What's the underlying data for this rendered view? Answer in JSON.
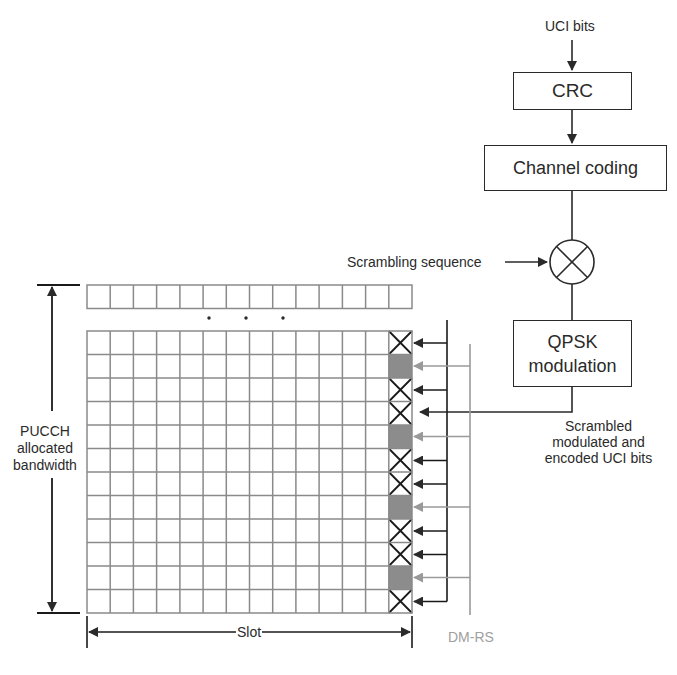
{
  "diagram": {
    "input_label": "UCI bits",
    "blocks": [
      {
        "id": "crc",
        "label": "CRC"
      },
      {
        "id": "channel_coding",
        "label": "Channel coding"
      },
      {
        "id": "scrambler",
        "label": "⊗",
        "shape": "circle-multiply"
      },
      {
        "id": "qpsk",
        "label_line1": "QPSK",
        "label_line2": "modulation"
      }
    ],
    "scrambling_label": "Scrambling sequence",
    "output_label_lines": [
      "Scrambled",
      "modulated and",
      "encoded UCI bits"
    ],
    "bandwidth_label_lines": [
      "PUCCH",
      "allocated",
      "bandwidth"
    ],
    "slot_label": "Slot",
    "dmrs_label": "DM-RS",
    "ellipsis": "· · ·",
    "grid": {
      "columns": 14,
      "rows": 12,
      "last_column_pattern": [
        "uci",
        "dmrs",
        "uci",
        "uci",
        "dmrs",
        "uci",
        "uci",
        "dmrs",
        "uci",
        "uci",
        "dmrs",
        "uci"
      ],
      "top_strip_columns": 14
    },
    "colors": {
      "line": "#2a2a2a",
      "grid": "#8a8a8a",
      "dmrs_fill": "#8c8c8c",
      "dmrs_arrow": "#9a9a9a",
      "dmrs_text": "#a0a0a0"
    }
  }
}
